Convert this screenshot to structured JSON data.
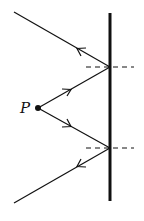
{
  "diagram": {
    "type": "ray-reflection",
    "point_label": "P",
    "mirror": {
      "x": 110,
      "y1": 13,
      "y2": 201
    },
    "source": {
      "x": 38,
      "y": 108
    },
    "reflections": [
      {
        "name": "upper",
        "x": 110,
        "y": 67,
        "incoming_from": "P",
        "outgoing_to": [
          14,
          12
        ]
      },
      {
        "name": "lower",
        "x": 110,
        "y": 148,
        "incoming_from": "P",
        "outgoing_to": [
          14,
          203
        ]
      }
    ],
    "normals": "dashed horizontal lines at reflection points",
    "colors": {
      "line": "#111111",
      "background": "#ffffff"
    }
  }
}
